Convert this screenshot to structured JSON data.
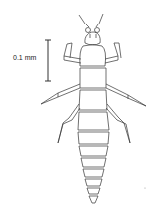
{
  "figure": {
    "scale_bar": {
      "label": "0.1 mm"
    }
  }
}
